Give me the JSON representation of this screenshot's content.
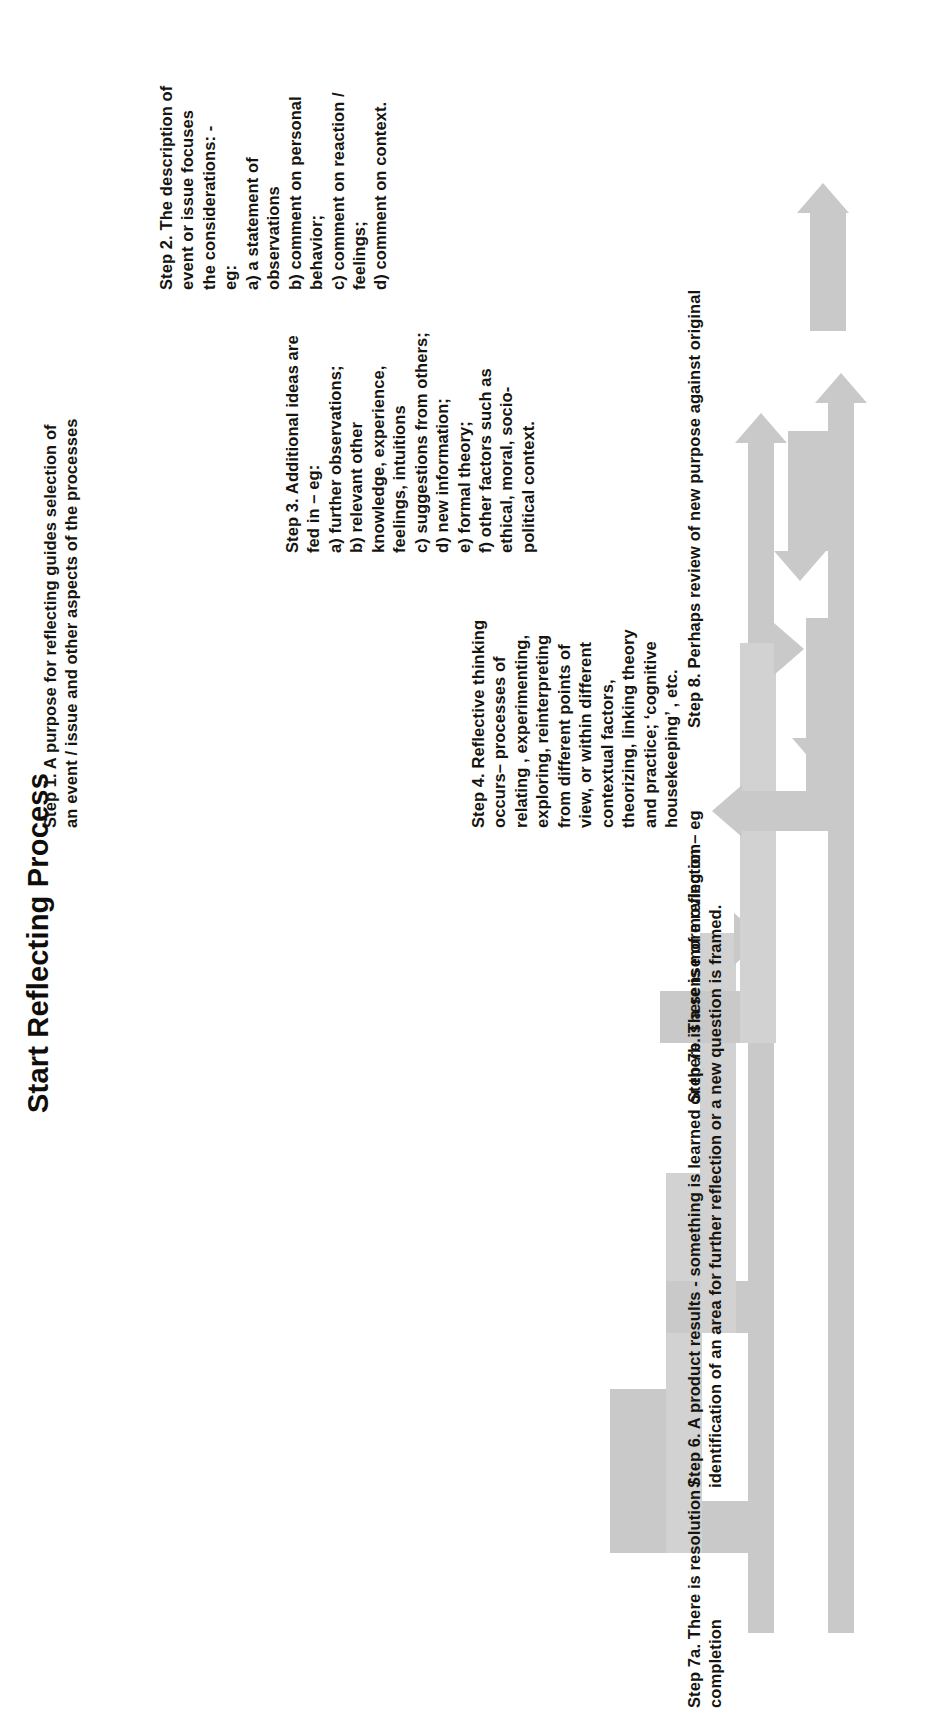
{
  "title": "Start Reflecting Process",
  "theme": {
    "background": "#ffffff",
    "arrow_fill": "#c9c9c9",
    "arrow_fill_light": "#d2d2d2",
    "text_color": "#16140f"
  },
  "orientation": "page is rotated 90 degrees; all text reads bottom-to-top",
  "steps": [
    {
      "id": "step1",
      "label": "Step 1. A purpose for reflecting guides selection of an event / issue and other aspects of the processes"
    },
    {
      "id": "step2",
      "label": "Step 2. The description of event or issue focuses the considerations: -\neg:\na) a statement of observations\nb) comment on personal behavior;\nc) comment on reaction / feelings;\nd) comment on context."
    },
    {
      "id": "step3",
      "label": "Step 3. Additional ideas are fed in – eg:\na) further observations;\nb) relevant other knowledge, experience, feelings, intuitions\nc) suggestions from others;\nd) new information;\ne) formal theory;\nf) other factors such as ethical, moral, socio-political context."
    },
    {
      "id": "step4",
      "label": "Step 4. Reflective thinking occurs– processes of relating , experimenting, exploring, reinterpreting from different points of view, or within different contextual factors, theorizing, linking theory and practice; ‘cognitive housekeeping’ , etc."
    },
    {
      "id": "step6",
      "label": "Step 6. A product results - something is learned or there is a sense of moving on – eg identification of an area for further reflection or a new question is framed."
    },
    {
      "id": "step7a",
      "label": "Step 7a. There is resolution / completion"
    },
    {
      "id": "step7b",
      "label": "Step 7b. There is more reflection"
    },
    {
      "id": "step8",
      "label": "Step 8. Perhaps review of new purpose against original"
    }
  ],
  "arrows": [
    {
      "id": "main-spine",
      "direction": "up",
      "semantic": "start-reflecting-process-spine"
    },
    {
      "id": "step1-feed",
      "direction": "up",
      "semantic": "step-1-feed-in"
    },
    {
      "id": "step2-feed",
      "direction": "right",
      "semantic": "step-2-feed-in"
    },
    {
      "id": "step3-feed",
      "direction": "right",
      "semantic": "step-3-feed-in"
    },
    {
      "id": "step4-feed",
      "direction": "right",
      "semantic": "step-4-feed-in"
    },
    {
      "id": "step6-return",
      "direction": "left",
      "semantic": "step-6-product-results"
    },
    {
      "id": "step7a-exit",
      "direction": "down",
      "semantic": "step-7a-resolution"
    },
    {
      "id": "step7b-loop",
      "direction": "left",
      "semantic": "step-7b-more-reflection"
    },
    {
      "id": "step8-loop",
      "direction": "up",
      "semantic": "step-8-review-loop"
    }
  ]
}
